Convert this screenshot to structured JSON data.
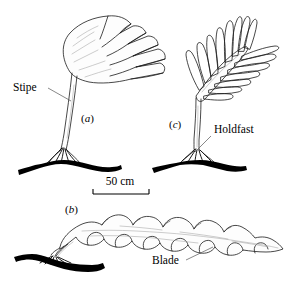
{
  "figure": {
    "background_color": "#ffffff",
    "ink_color": "#1a1a1a",
    "substrate_color": "#000000",
    "panels": [
      {
        "id": "a",
        "label": "(a)",
        "letter": "a",
        "form": "fan-shaped split blade"
      },
      {
        "id": "b",
        "label": "(b)",
        "letter": "b",
        "form": "horizontal undulating strap blade"
      },
      {
        "id": "c",
        "label": "(c)",
        "letter": "c",
        "form": "pinnate blade with rachis"
      }
    ],
    "annotations": [
      {
        "name": "stipe",
        "text": "Stipe",
        "panel": "a"
      },
      {
        "name": "holdfast",
        "text": "Holdfast",
        "panel": "c"
      },
      {
        "name": "blade",
        "text": "Blade",
        "panel": "b"
      }
    ],
    "scale_bar": {
      "text": "50 cm",
      "value": 50,
      "unit": "cm"
    }
  }
}
